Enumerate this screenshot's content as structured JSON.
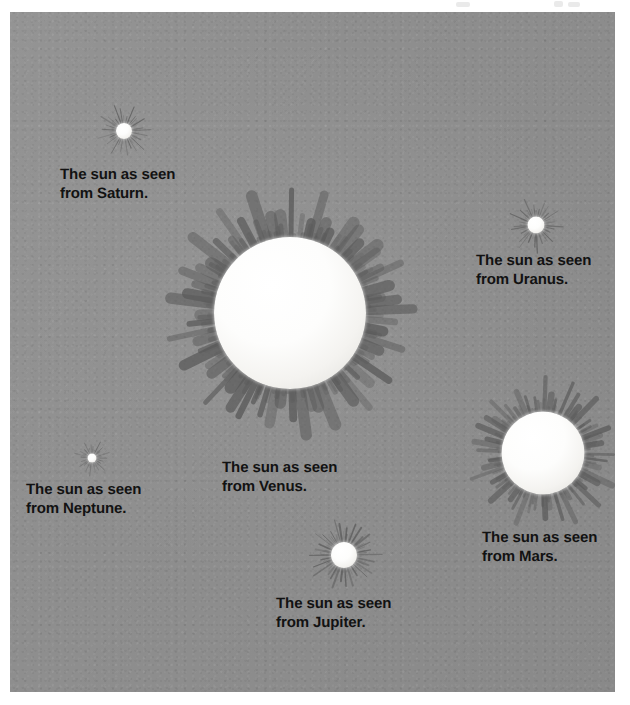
{
  "figure": {
    "medium": "scanned illustration plate",
    "plate_color": "#8e8e8e",
    "page_color": "#ffffff",
    "caption_color": "#121212",
    "sun_disc_color": "#ffffff",
    "ray_color": "#5a5a5a"
  },
  "suns": [
    {
      "id": "saturn",
      "planet": "Saturn",
      "caption": "The sun as seen\nfrom Saturn.",
      "disc_diameter_px": 16,
      "ray_span_px": 54,
      "ray_count": 26,
      "center": {
        "x": 124,
        "y": 131
      },
      "caption_pos": {
        "x": 60,
        "y": 166
      },
      "caption_size_px": 15
    },
    {
      "id": "venus",
      "planet": "Venus",
      "caption": "The sun as seen\nfrom Venus.",
      "disc_diameter_px": 152,
      "ray_span_px": 246,
      "ray_count": 64,
      "center": {
        "x": 290,
        "y": 313
      },
      "caption_pos": {
        "x": 222,
        "y": 459
      },
      "caption_size_px": 15
    },
    {
      "id": "uranus",
      "planet": "Uranus",
      "caption": "The sun as seen\nfrom Uranus.",
      "disc_diameter_px": 17,
      "ray_span_px": 56,
      "ray_count": 26,
      "center": {
        "x": 536,
        "y": 225
      },
      "caption_pos": {
        "x": 476,
        "y": 252
      },
      "caption_size_px": 15
    },
    {
      "id": "mars",
      "planet": "Mars",
      "caption": "The sun as seen\nfrom Mars.",
      "disc_diameter_px": 83,
      "ray_span_px": 152,
      "ray_count": 48,
      "center": {
        "x": 543,
        "y": 453
      },
      "caption_pos": {
        "x": 482,
        "y": 529
      },
      "caption_size_px": 15
    },
    {
      "id": "neptune",
      "planet": "Neptune",
      "caption": "The sun as seen\nfrom Neptune.",
      "disc_diameter_px": 9,
      "ray_span_px": 36,
      "ray_count": 22,
      "center": {
        "x": 92,
        "y": 458
      },
      "caption_pos": {
        "x": 26,
        "y": 481
      },
      "caption_size_px": 15
    },
    {
      "id": "jupiter",
      "planet": "Jupiter",
      "caption": "The sun as seen\nfrom Jupiter.",
      "disc_diameter_px": 26,
      "ray_span_px": 76,
      "ray_count": 30,
      "center": {
        "x": 344,
        "y": 555
      },
      "caption_pos": {
        "x": 276,
        "y": 595
      },
      "caption_size_px": 15
    }
  ],
  "plate": {
    "left": 10,
    "top": 12,
    "width": 605,
    "height": 680
  },
  "artifacts": [
    {
      "x": 456,
      "y": 2,
      "w": 14,
      "h": 5
    },
    {
      "x": 554,
      "y": 1,
      "w": 9,
      "h": 6
    },
    {
      "x": 568,
      "y": 2,
      "w": 12,
      "h": 5
    }
  ]
}
